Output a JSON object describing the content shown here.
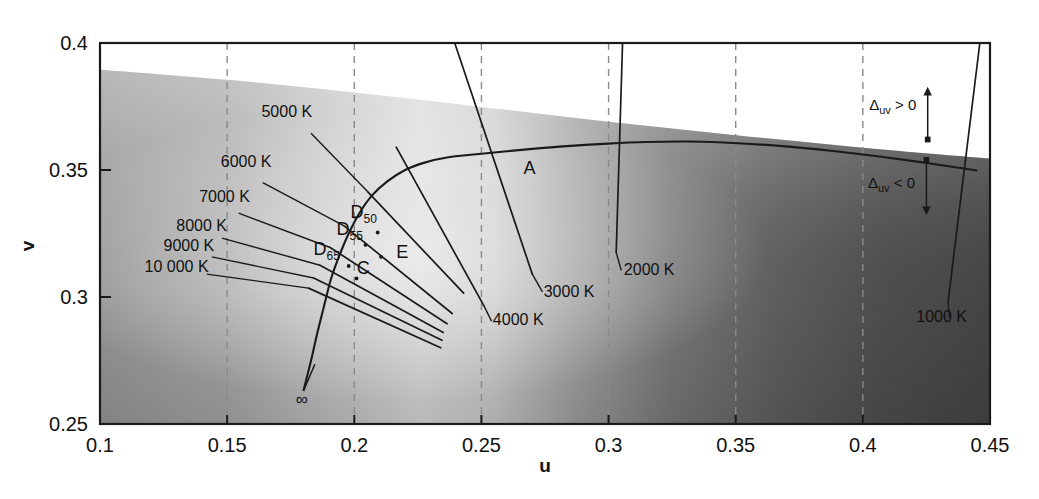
{
  "chart_data": {
    "type": "line",
    "xlabel": "u",
    "ylabel": "v",
    "xlim": [
      0.1,
      0.45
    ],
    "ylim": [
      0.25,
      0.4
    ],
    "grid": "dashed vertical gridlines at each major x tick",
    "legend": "none",
    "xticks": [
      "0.1",
      "0.15",
      "0.2",
      "0.25",
      "0.3",
      "0.35",
      "0.4",
      "0.45"
    ],
    "xtick_values": [
      0.1,
      0.15,
      0.2,
      0.25,
      0.3,
      0.35,
      0.4,
      0.45
    ],
    "yticks": [
      "0.25",
      "0.3",
      "0.35",
      "0.4"
    ],
    "ytick_values": [
      0.25,
      0.3,
      0.35,
      0.4
    ],
    "series": [
      {
        "name": "Planckian locus",
        "points": [
          [
            0.18,
            0.263
          ],
          [
            0.183,
            0.275
          ],
          [
            0.1855,
            0.286
          ],
          [
            0.188,
            0.296
          ],
          [
            0.1908,
            0.307
          ],
          [
            0.194,
            0.316
          ],
          [
            0.1978,
            0.325
          ],
          [
            0.202,
            0.333
          ],
          [
            0.207,
            0.34
          ],
          [
            0.213,
            0.3455
          ],
          [
            0.22,
            0.35
          ],
          [
            0.228,
            0.353
          ],
          [
            0.237,
            0.355
          ],
          [
            0.247,
            0.3561
          ],
          [
            0.258,
            0.3572
          ],
          [
            0.27,
            0.3583
          ],
          [
            0.285,
            0.3595
          ],
          [
            0.3,
            0.3604
          ],
          [
            0.315,
            0.361
          ],
          [
            0.33,
            0.3612
          ],
          [
            0.345,
            0.3608
          ],
          [
            0.36,
            0.36
          ],
          [
            0.375,
            0.3588
          ],
          [
            0.39,
            0.3573
          ],
          [
            0.405,
            0.3555
          ],
          [
            0.42,
            0.3535
          ],
          [
            0.435,
            0.3513
          ],
          [
            0.445,
            0.3498
          ]
        ]
      }
    ],
    "isotherms": [
      {
        "label": "5000 K",
        "value": 5000,
        "line": [
          [
            0.2055,
            0.3412
          ],
          [
            0.243,
            0.3015
          ]
        ],
        "label_xy": [
          0.1635,
          0.3708
        ],
        "leader": [
          [
            0.183,
            0.3645
          ],
          [
            0.2055,
            0.3412
          ]
        ]
      },
      {
        "label": "6000 K",
        "value": 6000,
        "line": [
          [
            0.196,
            0.328
          ],
          [
            0.2385,
            0.2935
          ]
        ],
        "label_xy": [
          0.1475,
          0.351
        ],
        "leader": [
          [
            0.164,
            0.345
          ],
          [
            0.196,
            0.328
          ]
        ]
      },
      {
        "label": "7000 K",
        "value": 7000,
        "line": [
          [
            0.1905,
            0.3195
          ],
          [
            0.2365,
            0.2895
          ]
        ],
        "label_xy": [
          0.139,
          0.3375
        ],
        "leader": [
          [
            0.1545,
            0.333
          ],
          [
            0.1905,
            0.3195
          ]
        ]
      },
      {
        "label": "8000 K",
        "value": 8000,
        "line": [
          [
            0.1865,
            0.3125
          ],
          [
            0.235,
            0.286
          ]
        ],
        "label_xy": [
          0.13,
          0.326
        ],
        "leader": [
          [
            0.148,
            0.3232
          ],
          [
            0.1865,
            0.3125
          ]
        ]
      },
      {
        "label": "9000 K",
        "value": 9000,
        "line": [
          [
            0.184,
            0.3075
          ],
          [
            0.2345,
            0.283
          ]
        ],
        "label_xy": [
          0.125,
          0.318
        ],
        "leader": [
          [
            0.144,
            0.3158
          ],
          [
            0.184,
            0.3075
          ]
        ]
      },
      {
        "label": "10 000 K",
        "value": 10000,
        "line": [
          [
            0.182,
            0.3035
          ],
          [
            0.234,
            0.28
          ]
        ],
        "label_xy": [
          0.1175,
          0.31
        ],
        "leader": [
          [
            0.142,
            0.309
          ],
          [
            0.182,
            0.3035
          ]
        ]
      },
      {
        "label": "4000 K",
        "value": 4000,
        "line": [
          [
            0.2165,
            0.359
          ],
          [
            0.251,
            0.2965
          ]
        ],
        "label_xy": [
          0.2545,
          0.289
        ],
        "leader": [
          [
            0.251,
            0.2965
          ],
          [
            0.254,
            0.2905
          ]
        ]
      },
      {
        "label": "3000 K",
        "value": 3000,
        "line": [
          [
            0.2395,
            0.4
          ],
          [
            0.27,
            0.309
          ]
        ],
        "label_xy": [
          0.2745,
          0.3
        ],
        "leader": [
          [
            0.27,
            0.309
          ],
          [
            0.274,
            0.302
          ]
        ]
      },
      {
        "label": "2000 K",
        "value": 2000,
        "line": [
          [
            0.3055,
            0.4
          ],
          [
            0.303,
            0.3175
          ]
        ],
        "label_xy": [
          0.306,
          0.3085
        ],
        "leader": [
          [
            0.303,
            0.3175
          ],
          [
            0.305,
            0.3105
          ]
        ]
      },
      {
        "label": "1000 K",
        "value": 1000,
        "line": [
          [
            0.446,
            0.4
          ],
          [
            0.4335,
            0.298
          ]
        ],
        "label_xy": [
          0.421,
          0.29
        ],
        "leader": [
          [
            0.4335,
            0.298
          ],
          [
            0.434,
            0.292
          ]
        ]
      }
    ],
    "illuminants": [
      {
        "label": "A",
        "u": 0.256,
        "v": 0.359,
        "label_xy": [
          0.2665,
          0.3485
        ],
        "dot": false
      },
      {
        "label": "D",
        "sub": "50",
        "u": 0.2092,
        "v": 0.3254,
        "label_xy": [
          0.1985,
          0.331
        ],
        "dot": true
      },
      {
        "label": "D",
        "sub": "55",
        "u": 0.2044,
        "v": 0.3205,
        "label_xy": [
          0.193,
          0.3245
        ],
        "dot": true
      },
      {
        "label": "D",
        "sub": "65",
        "u": 0.1978,
        "v": 0.3122,
        "label_xy": [
          0.184,
          0.3165
        ],
        "dot": true
      },
      {
        "label": "C",
        "u": 0.2009,
        "v": 0.3073,
        "label_xy": [
          0.201,
          0.309
        ],
        "dot": true
      },
      {
        "label": "E",
        "u": 0.2105,
        "v": 0.3158,
        "label_xy": [
          0.2165,
          0.3155
        ],
        "dot": true
      }
    ],
    "annotations": [
      {
        "name": "delta-uv-positive",
        "base": "Δ",
        "sub": "uv",
        "rest": " > 0",
        "label_xy": [
          0.4025,
          0.3737
        ],
        "arrow": {
          "from": [
            0.4255,
            0.362
          ],
          "to": [
            0.4255,
            0.381
          ]
        }
      },
      {
        "name": "delta-uv-negative",
        "base": "Δ",
        "sub": "uv",
        "rest": " < 0",
        "label_xy": [
          0.402,
          0.343
        ],
        "arrow": {
          "from": [
            0.425,
            0.354
          ],
          "to": [
            0.425,
            0.334
          ]
        }
      },
      {
        "name": "infinity-marker",
        "base": "∞",
        "label_xy": [
          0.177,
          0.2575
        ],
        "leader": [
          [
            0.18,
            0.263
          ],
          [
            0.1845,
            0.2735
          ]
        ]
      }
    ],
    "regions": {
      "above_locus_white": "white band above the chromaticity gamut in the upper area",
      "gamut_fill": "grayscale gradient representing chromaticity colors rendered monochrome"
    }
  },
  "colors": {
    "axis": "#1a1a1a",
    "gridline": "#8a8a8a",
    "curve": "#1a1a1a",
    "text": "#111111",
    "background": "#ffffff",
    "gamut_light": "#e9e9e9",
    "gamut_mid": "#9a9a9a",
    "gamut_dark": "#4a4a4a"
  },
  "axes": {
    "x_title": "u",
    "y_title": "v"
  }
}
